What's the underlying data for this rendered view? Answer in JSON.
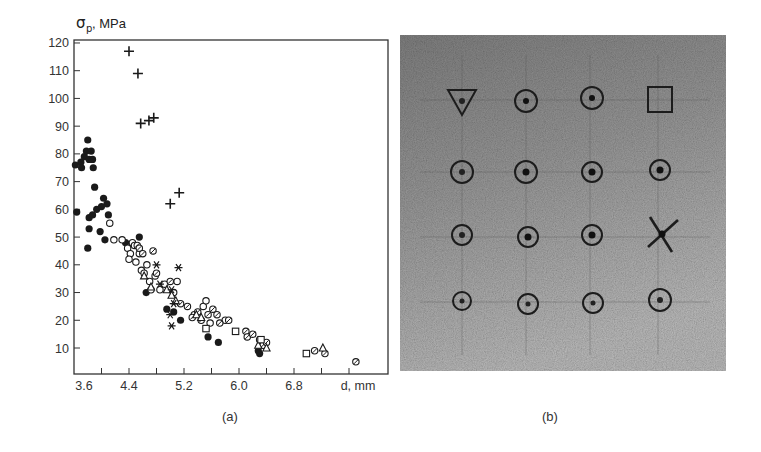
{
  "panels": {
    "a": {
      "caption": "(a)",
      "ylabel_sigma": "σ",
      "ylabel_sub": "p",
      "ylabel_unit": ", MPa",
      "xlabel": "d, mm"
    },
    "b": {
      "caption": "(b)",
      "description": "Photograph of specimen surface with 4x4 grid of indentation marks; markers: triangle, square, cross and circles"
    }
  },
  "chart_data": {
    "type": "scatter",
    "title": "",
    "xlabel": "d, mm",
    "ylabel": "σp , MPa",
    "xlim": [
      3.6,
      8.2
    ],
    "ylim": [
      0,
      122
    ],
    "xticks": [
      3.6,
      4.0,
      4.4,
      4.8,
      5.2,
      5.6,
      6.0,
      6.4,
      6.8,
      7.2,
      7.6
    ],
    "xtick_labels": [
      "3.6",
      "4.4",
      "5.2",
      "6.0",
      "6.8"
    ],
    "xtick_label_values": [
      3.6,
      4.4,
      5.2,
      6.0,
      6.8
    ],
    "yticks": [
      10,
      20,
      30,
      40,
      50,
      60,
      70,
      80,
      90,
      100,
      110,
      120
    ],
    "ytick_labels": [
      "10",
      "20",
      "30",
      "40",
      "50",
      "60",
      "70",
      "80",
      "90",
      "100",
      "110",
      "120"
    ],
    "grid": false,
    "legend": null,
    "series": [
      {
        "name": "plus",
        "marker": "plus",
        "points": [
          [
            4.4,
            117
          ],
          [
            4.53,
            109
          ],
          [
            4.57,
            91
          ],
          [
            4.69,
            92
          ],
          [
            4.76,
            93
          ],
          [
            5.0,
            62
          ],
          [
            5.13,
            66
          ]
        ]
      },
      {
        "name": "filled-circle",
        "marker": "filled-circle",
        "points": [
          [
            3.62,
            76
          ],
          [
            3.64,
            59
          ],
          [
            3.7,
            77
          ],
          [
            3.71,
            75
          ],
          [
            3.75,
            79
          ],
          [
            3.78,
            81
          ],
          [
            3.8,
            85
          ],
          [
            3.82,
            78
          ],
          [
            3.85,
            81
          ],
          [
            3.87,
            78
          ],
          [
            3.88,
            75
          ],
          [
            3.9,
            68
          ],
          [
            3.8,
            46
          ],
          [
            3.82,
            53
          ],
          [
            3.82,
            57
          ],
          [
            3.87,
            58
          ],
          [
            3.93,
            60
          ],
          [
            4.0,
            61
          ],
          [
            4.03,
            64
          ],
          [
            4.08,
            62
          ],
          [
            4.1,
            58
          ],
          [
            3.98,
            52
          ],
          [
            4.05,
            49
          ],
          [
            4.55,
            50
          ],
          [
            4.35,
            48
          ],
          [
            4.65,
            30
          ],
          [
            4.95,
            24
          ],
          [
            5.05,
            23
          ],
          [
            5.15,
            20
          ],
          [
            5.55,
            14
          ],
          [
            5.7,
            12
          ],
          [
            6.28,
            9
          ],
          [
            6.3,
            8
          ]
        ]
      },
      {
        "name": "open-circle",
        "marker": "open-circle",
        "points": [
          [
            4.12,
            55
          ],
          [
            4.18,
            49
          ],
          [
            4.3,
            49
          ],
          [
            4.38,
            46
          ],
          [
            4.42,
            44
          ],
          [
            4.45,
            48
          ],
          [
            4.48,
            47
          ],
          [
            4.4,
            42
          ],
          [
            4.5,
            41
          ],
          [
            4.55,
            44
          ],
          [
            4.58,
            38
          ],
          [
            4.62,
            37
          ],
          [
            4.66,
            40
          ],
          [
            4.7,
            34
          ],
          [
            4.78,
            36
          ],
          [
            4.72,
            31
          ],
          [
            4.85,
            31
          ],
          [
            4.92,
            33
          ],
          [
            5.05,
            30
          ],
          [
            5.1,
            34
          ],
          [
            5.35,
            22
          ],
          [
            5.48,
            25
          ],
          [
            5.52,
            27
          ],
          [
            5.58,
            19
          ],
          [
            5.8,
            20
          ]
        ]
      },
      {
        "name": "hatched-circle",
        "marker": "hatched-circle",
        "points": [
          [
            4.52,
            47
          ],
          [
            4.55,
            46
          ],
          [
            4.6,
            44
          ],
          [
            4.75,
            45
          ],
          [
            4.8,
            37
          ],
          [
            5.0,
            34
          ],
          [
            5.15,
            26
          ],
          [
            5.25,
            25
          ],
          [
            5.32,
            21
          ],
          [
            5.4,
            23
          ],
          [
            5.45,
            20
          ],
          [
            5.55,
            22
          ],
          [
            5.62,
            24
          ],
          [
            5.68,
            22
          ],
          [
            5.72,
            19
          ],
          [
            5.85,
            20
          ],
          [
            6.1,
            16
          ],
          [
            6.12,
            14
          ],
          [
            6.2,
            15
          ],
          [
            6.3,
            13
          ],
          [
            6.35,
            11
          ],
          [
            6.4,
            12
          ],
          [
            7.1,
            9
          ],
          [
            7.25,
            8
          ],
          [
            7.7,
            5
          ]
        ]
      },
      {
        "name": "triangle",
        "marker": "triangle",
        "points": [
          [
            4.62,
            36
          ],
          [
            4.72,
            32
          ],
          [
            4.95,
            31
          ],
          [
            5.02,
            29
          ],
          [
            5.08,
            27
          ],
          [
            5.38,
            22
          ],
          [
            5.45,
            21
          ],
          [
            6.28,
            11
          ],
          [
            6.4,
            10
          ],
          [
            7.22,
            10
          ]
        ]
      },
      {
        "name": "asterisk",
        "marker": "asterisk",
        "points": [
          [
            4.8,
            40
          ],
          [
            4.85,
            33
          ],
          [
            5.02,
            31
          ],
          [
            5.05,
            26
          ],
          [
            5.0,
            22
          ],
          [
            5.02,
            18
          ],
          [
            5.12,
            39
          ]
        ]
      },
      {
        "name": "square",
        "marker": "square",
        "points": [
          [
            5.52,
            17
          ],
          [
            5.95,
            16
          ],
          [
            6.32,
            13
          ],
          [
            6.98,
            8
          ]
        ]
      }
    ]
  }
}
